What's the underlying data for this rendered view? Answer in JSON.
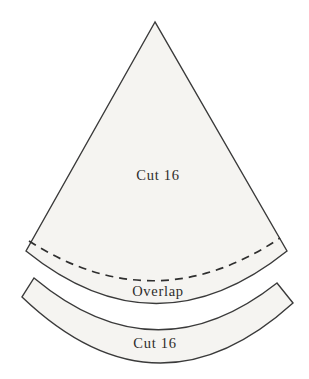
{
  "diagram": {
    "pieces": {
      "wedge": {
        "label": "Cut 16"
      },
      "overlap_line": {
        "label": "Overlap"
      },
      "band": {
        "label": "Cut 16"
      }
    },
    "colors": {
      "piece_fill": "#f5f4f1",
      "outline": "#3a3a3a",
      "label_text": "#2e2d2b",
      "background": "#ffffff"
    }
  }
}
